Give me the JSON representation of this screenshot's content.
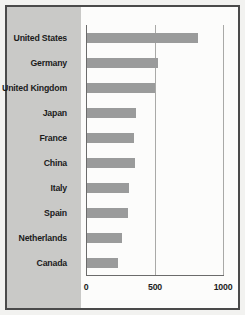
{
  "chart_data": {
    "type": "bar",
    "orientation": "horizontal",
    "title": "",
    "subtitle": "",
    "xlabel": "",
    "ylabel": "",
    "categories": [
      "United States",
      "Germany",
      "United Kingdom",
      "Japan",
      "France",
      "China",
      "Italy",
      "Spain",
      "Netherlands",
      "Canada"
    ],
    "values": [
      818,
      527,
      505,
      366,
      353,
      360,
      311,
      306,
      264,
      232
    ],
    "xlim": [
      0,
      1000
    ],
    "xticks": [
      0,
      500,
      1000
    ],
    "xticklabels": [
      "0",
      "500",
      "1000"
    ],
    "grid": true,
    "grid_axis": "x",
    "legend": false,
    "bar_color": "#9a9b9b",
    "label_panel_color": "#c9c9c7",
    "plot_background": "#fcfcfb",
    "frame_color": "#4a4a4a",
    "text_color": "#1b1b1b"
  }
}
